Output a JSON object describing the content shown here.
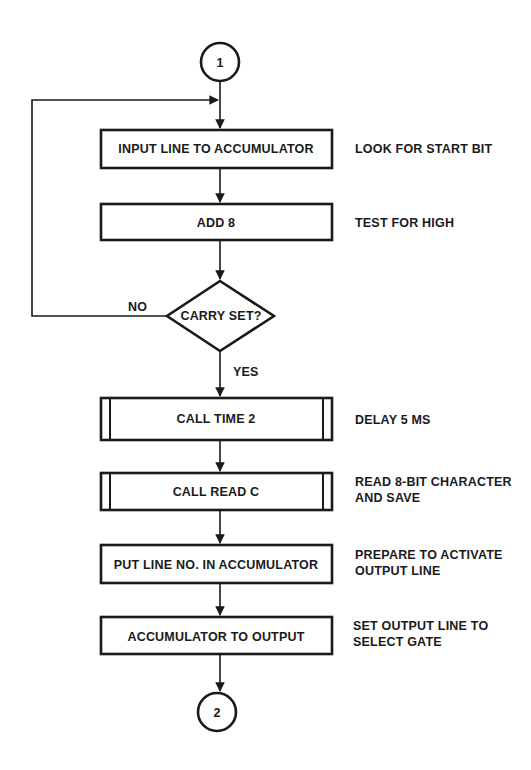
{
  "connectors": {
    "start": "1",
    "end": "2"
  },
  "steps": [
    {
      "label": "INPUT LINE TO ACCUMULATOR",
      "type": "process",
      "annotation": [
        "LOOK FOR START BIT"
      ]
    },
    {
      "label": "ADD 8",
      "type": "process",
      "annotation": [
        "TEST FOR HIGH"
      ]
    },
    {
      "label": "CARRY SET?",
      "type": "decision",
      "no_label": "NO",
      "yes_label": "YES"
    },
    {
      "label": "CALL TIME 2",
      "type": "subroutine",
      "annotation": [
        "DELAY 5 MS"
      ]
    },
    {
      "label": "CALL READ C",
      "type": "subroutine",
      "annotation": [
        "READ 8-BIT CHARACTER",
        "AND SAVE"
      ]
    },
    {
      "label": "PUT LINE NO. IN ACCUMULATOR",
      "type": "process",
      "annotation": [
        "PREPARE TO ACTIVATE",
        "OUTPUT LINE"
      ]
    },
    {
      "label": "ACCUMULATOR TO OUTPUT",
      "type": "process",
      "annotation": [
        "SET OUTPUT LINE TO",
        "SELECT GATE"
      ]
    }
  ]
}
